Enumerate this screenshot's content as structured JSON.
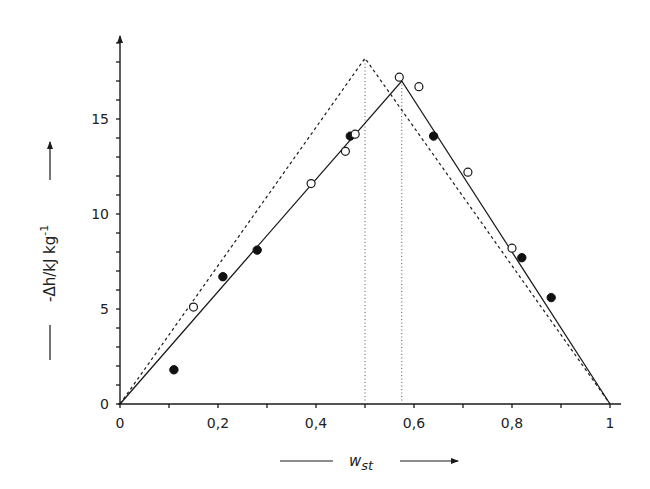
{
  "chart_data": {
    "type": "scatter",
    "title": "",
    "xlabel": "w_st",
    "xlabel_main": "w",
    "xlabel_sub": "st",
    "ylabel": "-Δh/kJ kg⁻¹",
    "ylabel_main": "-Δh/kJ kg",
    "ylabel_sup": "-1",
    "xlim": [
      0,
      1
    ],
    "ylim": [
      0,
      19
    ],
    "grid": false,
    "legend": "none",
    "x_ticks": [
      0,
      0.1,
      0.2,
      0.3,
      0.4,
      0.5,
      0.6,
      0.7,
      0.8,
      0.9,
      1.0
    ],
    "x_tick_labels": [
      {
        "value": 0,
        "label": "0"
      },
      {
        "value": 0.2,
        "label": "0,2"
      },
      {
        "value": 0.4,
        "label": "0,4"
      },
      {
        "value": 0.6,
        "label": "0,6"
      },
      {
        "value": 0.8,
        "label": "0,8"
      },
      {
        "value": 1.0,
        "label": "1"
      }
    ],
    "y_ticks": [
      0,
      1,
      2,
      3,
      4,
      5,
      6,
      7,
      8,
      9,
      10,
      11,
      12,
      13,
      14,
      15,
      16,
      17,
      18,
      19
    ],
    "y_tick_labels": [
      {
        "value": 0,
        "label": "0"
      },
      {
        "value": 5,
        "label": "5"
      },
      {
        "value": 10,
        "label": "10"
      },
      {
        "value": 15,
        "label": "15"
      }
    ],
    "series": [
      {
        "name": "filled circles",
        "marker": "filled-circle",
        "points": [
          {
            "x": 0.11,
            "y": 1.8
          },
          {
            "x": 0.21,
            "y": 6.7
          },
          {
            "x": 0.28,
            "y": 8.1
          },
          {
            "x": 0.47,
            "y": 14.1
          },
          {
            "x": 0.64,
            "y": 14.1
          },
          {
            "x": 0.82,
            "y": 7.7
          },
          {
            "x": 0.88,
            "y": 5.6
          }
        ]
      },
      {
        "name": "open circles",
        "marker": "open-circle",
        "points": [
          {
            "x": 0.15,
            "y": 5.1
          },
          {
            "x": 0.39,
            "y": 11.6
          },
          {
            "x": 0.46,
            "y": 13.3
          },
          {
            "x": 0.48,
            "y": 14.2
          },
          {
            "x": 0.57,
            "y": 17.2
          },
          {
            "x": 0.61,
            "y": 16.7
          },
          {
            "x": 0.71,
            "y": 12.2
          },
          {
            "x": 0.8,
            "y": 8.2
          }
        ]
      },
      {
        "name": "solid fit lines",
        "style": "solid",
        "points": [
          {
            "x": 0,
            "y": 0
          },
          {
            "x": 0.575,
            "y": 17.0
          },
          {
            "x": 1.0,
            "y": 0
          }
        ]
      },
      {
        "name": "dashed ideal lines",
        "style": "dashed",
        "points": [
          {
            "x": 0,
            "y": 0
          },
          {
            "x": 0.5,
            "y": 18.2
          },
          {
            "x": 1.0,
            "y": 0
          }
        ]
      }
    ],
    "annotations": [
      {
        "type": "vertical-dotted-line",
        "x": 0.5,
        "from_y": 0,
        "to_y": 18.2
      },
      {
        "type": "vertical-dotted-line",
        "x": 0.575,
        "from_y": 0,
        "to_y": 17.0
      }
    ]
  },
  "layout": {
    "origin_px": [
      120,
      404
    ],
    "x_px_per_unit": 490,
    "y_px_per_unit": 19,
    "y_axis_top_px": 30,
    "x_axis_right_px": 621
  },
  "colors": {
    "ink": "#1a1a1a",
    "background": "#ffffff"
  }
}
